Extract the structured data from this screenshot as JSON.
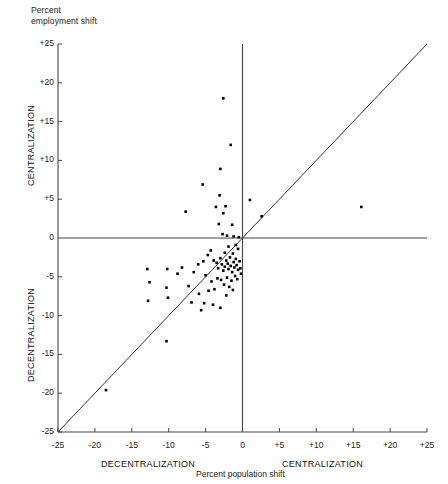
{
  "figure": {
    "corner_title": "Percent\nemployment shift",
    "x_unit_label": "Percent population shift",
    "y_axis_upper_label": "CENTRALIZATION",
    "y_axis_lower_label": "DECENTRALIZATION",
    "x_axis_left_label": "DECENTRALIZATION",
    "x_axis_right_label": "CENTRALIZATION",
    "point_color": "#000000",
    "axis_color": "#444444",
    "line_color": "#333333"
  },
  "chart_data": {
    "type": "scatter",
    "title": "Percent employment shift",
    "xlabel": "Percent population shift",
    "ylabel": "Percent employment shift",
    "xlim": [
      -25,
      25
    ],
    "ylim": [
      -25,
      25
    ],
    "grid": false,
    "legend": null,
    "xticks": [
      -25,
      -20,
      -15,
      -10,
      -5,
      0,
      5,
      10,
      15,
      20,
      25
    ],
    "xtick_labels": [
      "-25",
      "-20",
      "-15",
      "-10",
      "-5",
      "0",
      "+5",
      "+10",
      "+15",
      "+20",
      "+25"
    ],
    "yticks": [
      -25,
      -20,
      -15,
      -10,
      -5,
      0,
      5,
      10,
      15,
      20,
      25
    ],
    "ytick_labels": [
      "-25",
      "-20",
      "-15",
      "-10",
      "-5",
      "0",
      "+5",
      "+10",
      "+15",
      "+20",
      "+25"
    ],
    "annotations": [
      {
        "text": "CENTRALIZATION",
        "axis": "y",
        "region": "positive"
      },
      {
        "text": "DECENTRALIZATION",
        "axis": "y",
        "region": "negative"
      },
      {
        "text": "CENTRALIZATION",
        "axis": "x",
        "region": "positive"
      },
      {
        "text": "DECENTRALIZATION",
        "axis": "x",
        "region": "negative"
      }
    ],
    "reference_line": {
      "type": "identity",
      "equation": "y = x",
      "from": [
        -25,
        -25
      ],
      "to": [
        25,
        25
      ]
    },
    "series": [
      {
        "name": "Metropolitan areas",
        "marker": "square",
        "points": [
          [
            -2.6,
            18.0
          ],
          [
            -1.6,
            12.0
          ],
          [
            -3.0,
            8.9
          ],
          [
            -5.4,
            6.9
          ],
          [
            -3.1,
            5.5
          ],
          [
            1.0,
            4.9
          ],
          [
            -2.3,
            4.1
          ],
          [
            -3.6,
            4.0
          ],
          [
            -7.7,
            3.4
          ],
          [
            16.1,
            4.0
          ],
          [
            -2.6,
            3.2
          ],
          [
            2.6,
            2.8
          ],
          [
            -3.2,
            1.8
          ],
          [
            -1.4,
            1.7
          ],
          [
            -2.7,
            0.5
          ],
          [
            -2.1,
            0.3
          ],
          [
            -1.2,
            0.2
          ],
          [
            -0.5,
            0.1
          ],
          [
            -12.9,
            -4.0
          ],
          [
            -10.2,
            -4.0
          ],
          [
            -8.2,
            -3.8
          ],
          [
            -6.0,
            -3.4
          ],
          [
            -5.3,
            -3.0
          ],
          [
            -4.7,
            -2.2
          ],
          [
            -4.3,
            -1.6
          ],
          [
            -3.9,
            -2.9
          ],
          [
            -3.5,
            -3.2
          ],
          [
            -3.3,
            -3.9
          ],
          [
            -3.0,
            -2.6
          ],
          [
            -2.8,
            -3.4
          ],
          [
            -2.6,
            -4.2
          ],
          [
            -2.4,
            -3.7
          ],
          [
            -2.2,
            -2.9
          ],
          [
            -2.0,
            -3.3
          ],
          [
            -1.9,
            -4.0
          ],
          [
            -1.7,
            -2.5
          ],
          [
            -1.6,
            -3.6
          ],
          [
            -1.4,
            -4.4
          ],
          [
            -1.2,
            -3.1
          ],
          [
            -1.1,
            -3.8
          ],
          [
            -0.9,
            -2.7
          ],
          [
            -0.8,
            -3.5
          ],
          [
            -0.6,
            -4.1
          ],
          [
            -0.4,
            -3.0
          ],
          [
            -0.3,
            -3.9
          ],
          [
            -0.2,
            -4.6
          ],
          [
            -12.6,
            -5.7
          ],
          [
            -12.8,
            -8.1
          ],
          [
            -10.3,
            -6.4
          ],
          [
            -10.1,
            -7.7
          ],
          [
            -7.3,
            -6.2
          ],
          [
            -6.9,
            -8.3
          ],
          [
            -5.9,
            -7.2
          ],
          [
            -5.2,
            -8.4
          ],
          [
            -4.6,
            -6.8
          ],
          [
            -4.2,
            -5.6
          ],
          [
            -3.8,
            -6.6
          ],
          [
            -3.4,
            -5.2
          ],
          [
            -5.0,
            -4.8
          ],
          [
            -6.6,
            -4.4
          ],
          [
            -8.8,
            -4.6
          ],
          [
            -2.9,
            -5.4
          ],
          [
            -2.5,
            -6.0
          ],
          [
            -2.1,
            -5.1
          ],
          [
            -1.8,
            -6.3
          ],
          [
            -1.5,
            -5.5
          ],
          [
            -1.0,
            -4.9
          ],
          [
            -0.7,
            -5.3
          ],
          [
            -4.0,
            -8.6
          ],
          [
            -3.0,
            -9.0
          ],
          [
            -2.2,
            -7.4
          ],
          [
            -1.3,
            -6.7
          ],
          [
            -5.6,
            -9.3
          ],
          [
            -10.3,
            -13.3
          ],
          [
            -18.5,
            -19.6
          ],
          [
            -0.6,
            -1.4
          ],
          [
            -0.9,
            -0.9
          ],
          [
            -1.9,
            -1.1
          ],
          [
            -2.4,
            -1.9
          ],
          [
            -1.3,
            -2.0
          ]
        ]
      }
    ]
  }
}
